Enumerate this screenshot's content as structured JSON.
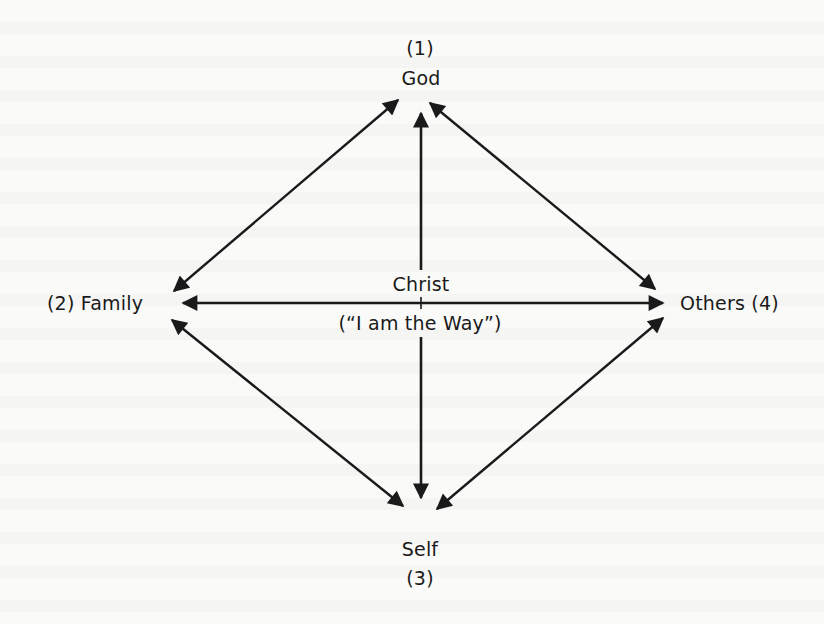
{
  "diagram": {
    "colors": {
      "ink": "#1a1a1a",
      "paper": "#fafaf8"
    },
    "nodes": {
      "top": {
        "number": "(1)",
        "label": "God"
      },
      "left": {
        "label": "(2) Family"
      },
      "bottom": {
        "label": "Self",
        "number": "(3)"
      },
      "right": {
        "label": "Others (4)"
      },
      "center": {
        "label": "Christ",
        "quote": "(“I am the Way”)"
      }
    },
    "edges": [
      {
        "from": "God",
        "to": "Family",
        "type": "double-arrow"
      },
      {
        "from": "God",
        "to": "Others",
        "type": "double-arrow"
      },
      {
        "from": "God",
        "to": "Self",
        "type": "double-arrow",
        "via": "Christ"
      },
      {
        "from": "Family",
        "to": "Others",
        "type": "double-arrow",
        "via": "Christ"
      },
      {
        "from": "Family",
        "to": "Self",
        "type": "double-arrow"
      },
      {
        "from": "Others",
        "to": "Self",
        "type": "double-arrow"
      }
    ]
  }
}
